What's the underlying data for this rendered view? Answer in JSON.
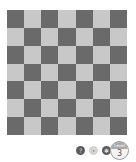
{
  "board": {
    "rows": 7,
    "cols": 7,
    "colors": {
      "dark": "#6a6a6a",
      "light": "#c8c8c8"
    },
    "pattern": [
      [
        "dark",
        "light",
        "dark",
        "light",
        "dark",
        "light",
        "dark"
      ],
      [
        "light",
        "dark",
        "light",
        "dark",
        "light",
        "dark",
        "light"
      ],
      [
        "dark",
        "light",
        "dark",
        "light",
        "dark",
        "light",
        "dark"
      ],
      [
        "light",
        "dark",
        "light",
        "dark",
        "light",
        "dark",
        "light"
      ],
      [
        "dark",
        "light",
        "dark",
        "light",
        "dark",
        "light",
        "dark"
      ],
      [
        "light",
        "dark",
        "light",
        "dark",
        "light",
        "dark",
        "light"
      ],
      [
        "dark",
        "light",
        "dark",
        "light",
        "dark",
        "light",
        "dark"
      ]
    ]
  },
  "controls": [
    {
      "name": "help-button",
      "icon": "help-icon",
      "glyph": "?",
      "style": "dark"
    },
    {
      "name": "hint-button",
      "icon": "hint-icon",
      "glyph": "•",
      "style": "light"
    },
    {
      "name": "settings-button",
      "icon": "gear-icon",
      "glyph": "✱",
      "style": "dark"
    }
  ],
  "level_badge": {
    "label": "Level",
    "value": "3"
  }
}
